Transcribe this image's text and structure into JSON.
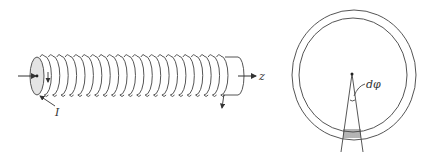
{
  "diagram": {
    "left_figure": {
      "description": "solenoid coil with current I along z-axis",
      "labels": {
        "axis": "z",
        "current": "I"
      },
      "turns": 22
    },
    "right_figure": {
      "description": "toroid cross-section with angular element",
      "labels": {
        "angle": "dφ"
      }
    },
    "colors": {
      "stroke": "#555555",
      "end_cap_fill": "#e4e4e4",
      "background": "#ffffff"
    }
  }
}
